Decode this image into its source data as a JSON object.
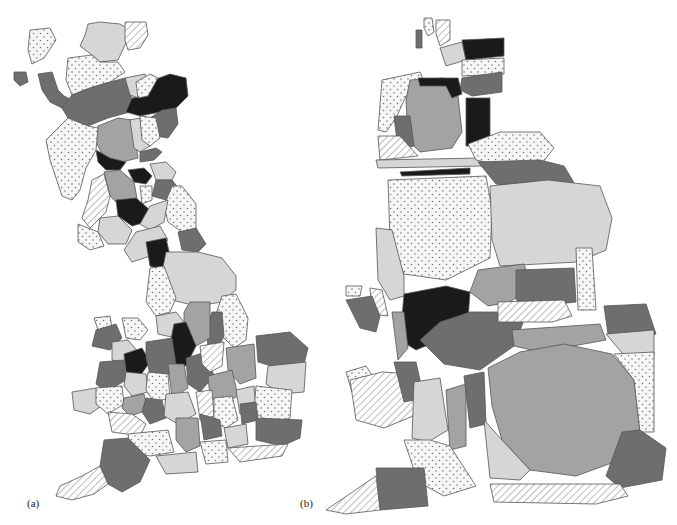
{
  "figure": {
    "panels": [
      {
        "id": "a",
        "label": "(a)",
        "description": "Geographic choropleth map of Great Britain by county/region"
      },
      {
        "id": "b",
        "label": "(b)",
        "description": "Population cartogram of Great Britain with same shading classes"
      }
    ],
    "shading_classes": [
      {
        "name": "black",
        "fill": "#1a1a1a"
      },
      {
        "name": "dark-gray",
        "fill": "#6e6e6e"
      },
      {
        "name": "medium-gray",
        "fill": "#a3a3a3"
      },
      {
        "name": "light-gray",
        "fill": "#d6d6d6"
      },
      {
        "name": "dotted",
        "fill": "#f4f4f4",
        "pattern": "dots"
      },
      {
        "name": "hatched",
        "fill": "#ffffff",
        "pattern": "diagonal-lines"
      }
    ]
  }
}
